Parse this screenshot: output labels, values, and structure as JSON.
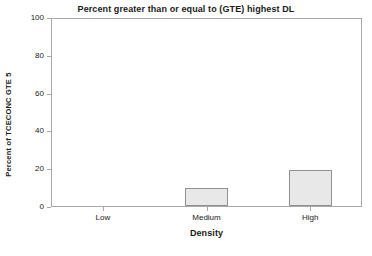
{
  "chart_data": {
    "type": "bar",
    "title": "Percent greater than or equal to (GTE) highest DL",
    "xlabel": "Density",
    "ylabel": "Percent of TCECONC GTE 5",
    "categories": [
      "Low",
      "Medium",
      "High"
    ],
    "values": [
      0,
      9.5,
      19
    ],
    "ylim": [
      0,
      100
    ],
    "yticks": [
      0,
      20,
      40,
      60,
      80,
      100
    ],
    "ytick_labels": [
      "0",
      "20",
      "40",
      "60",
      "80",
      "100"
    ],
    "grid": false,
    "legend": "none",
    "bar_fill_color": "#e8e8e8",
    "bar_border_color": "#909090",
    "axis_color": "#a8a8a8",
    "background_color": "#ffffff",
    "text_color": "#1a1a1a"
  }
}
